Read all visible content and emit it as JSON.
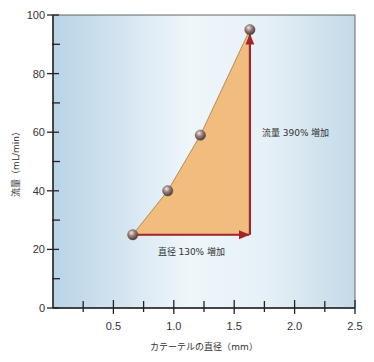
{
  "chart_data": {
    "type": "line",
    "title": "",
    "xlabel": "カテーテルの直径（mm）",
    "ylabel": "流量（mL/min）",
    "xlim": [
      0,
      2.5
    ],
    "ylim": [
      0,
      100
    ],
    "x_ticks": [
      0.5,
      1.0,
      1.5,
      2.0,
      2.5
    ],
    "x_tick_labels": [
      "0.5",
      "1.0",
      "1.5",
      "2.0",
      "2.5"
    ],
    "x_minor_ticks": [
      0.25,
      0.75,
      1.25,
      1.75,
      2.25
    ],
    "y_ticks": [
      0,
      20,
      40,
      60,
      80,
      100
    ],
    "y_tick_labels": [
      "0",
      "20",
      "40",
      "60",
      "80",
      "100"
    ],
    "y_minor_ticks": [
      10,
      30,
      50,
      70,
      90
    ],
    "grid": false,
    "legend": null,
    "series": [
      {
        "name": "流量",
        "x": [
          0.66,
          0.95,
          1.22,
          1.63
        ],
        "y": [
          25,
          40,
          59,
          95
        ]
      }
    ],
    "annotations": [
      {
        "text": "直径 130% 増加",
        "type": "horizontal-arrow",
        "from": [
          0.66,
          25
        ],
        "to": [
          1.63,
          25
        ]
      },
      {
        "text": "流量 390% 増加",
        "type": "vertical-arrow",
        "from": [
          1.63,
          25
        ],
        "to": [
          1.63,
          95
        ]
      }
    ],
    "colors": {
      "background_left": "#b9d3e6",
      "background_mid": "#eef6fa",
      "background_right": "#c4d9e8",
      "fill": "#f0bd7f",
      "arrow": "#a3242a",
      "point": "#8a6f6a",
      "axis": "#222222"
    }
  }
}
